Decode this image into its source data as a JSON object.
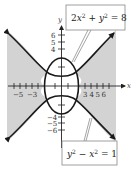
{
  "figure": {
    "type": "graph-of-system-of-inequalities",
    "axes": {
      "x_label": "x",
      "y_label": "y",
      "x_tick_labels": [
        "−5",
        "−3",
        "3",
        "4",
        "5",
        "6"
      ],
      "y_tick_labels_top": [
        "6",
        "5",
        "4"
      ],
      "y_tick_labels_bottom": [
        "−4",
        "−5",
        "−6"
      ]
    },
    "curves": [
      {
        "name": "ellipse",
        "equation": "2x² + y² = 8"
      },
      {
        "name": "hyperbola",
        "equation": "y² − x² = 1"
      }
    ],
    "callouts": {
      "top": {
        "text_parts": [
          "2",
          "x",
          "2",
          " + ",
          "y",
          "2",
          " = 8"
        ]
      },
      "bottom": {
        "text_parts": [
          "y",
          "2",
          " − ",
          "x",
          "2",
          " = 1"
        ]
      }
    },
    "colors": {
      "shade": "#d3d3d3",
      "curve": "#1a1a1a",
      "axis": "#222222",
      "box_border": "#888888"
    }
  }
}
